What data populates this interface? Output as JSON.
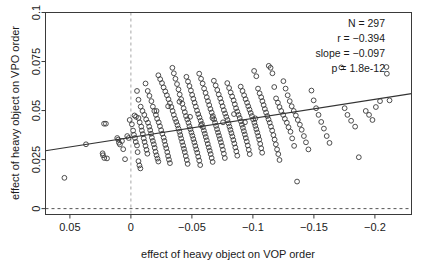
{
  "chart_data": {
    "type": "scatter",
    "title": "",
    "xlabel": "effect of heavy object on VOP order",
    "ylabel": "effect of heavy object on VPO order",
    "xlim": [
      0.07,
      -0.23
    ],
    "ylim": [
      -0.003,
      0.1
    ],
    "x_reversed": true,
    "grid": false,
    "legend": null,
    "xticks": [
      0.05,
      0,
      -0.05,
      -0.1,
      -0.15,
      -0.2
    ],
    "xtick_labels": [
      "0.05",
      "0",
      "-0.05",
      "-0.1",
      "-0.15",
      "-0.2"
    ],
    "yticks": [
      0,
      0.025,
      0.05,
      0.075,
      0.1
    ],
    "ytick_labels": [
      "0",
      "0.025",
      "0.05",
      "0.075",
      "0.1"
    ],
    "reference_lines": [
      {
        "name": "x-zero-line",
        "orientation": "vertical",
        "value": 0,
        "style": "dashed",
        "color": "#a6a6a6"
      },
      {
        "name": "y-zero-line",
        "orientation": "horizontal",
        "value": 0,
        "style": "dashed",
        "color": "#555555"
      }
    ],
    "fit_line": {
      "name": "regression-line",
      "slope": -0.097,
      "x_start": 0.07,
      "y_start": 0.0295,
      "x_end": -0.23,
      "y_end": 0.0586,
      "color": "#333333"
    },
    "annotations": {
      "n": "N = 297",
      "r": "r = −0.394",
      "slope": "slope = −0.097",
      "p": "p = 1.8e-12"
    },
    "marker": {
      "shape": "open-circle",
      "radius": 2.4,
      "stroke": "#3a3a3a",
      "fill": "none"
    },
    "points": [
      [
        0.0545,
        0.0157
      ],
      [
        0.0368,
        0.0328
      ],
      [
        0.022,
        0.0433
      ],
      [
        0.0205,
        0.0433
      ],
      [
        0.0232,
        0.0282
      ],
      [
        0.0229,
        0.0272
      ],
      [
        0.0218,
        0.0258
      ],
      [
        0.0196,
        0.0256
      ],
      [
        0.0112,
        0.036
      ],
      [
        0.0104,
        0.0352
      ],
      [
        0.0098,
        0.0336
      ],
      [
        0.009,
        0.0327
      ],
      [
        0.0073,
        0.0345
      ],
      [
        0.0063,
        0.0303
      ],
      [
        0.0048,
        0.0252
      ],
      [
        0.003,
        0.037
      ],
      [
        0.0018,
        0.036
      ],
      [
        0.001,
        0.0452
      ],
      [
        -0.0008,
        0.043
      ],
      [
        -0.0018,
        0.0398
      ],
      [
        -0.0025,
        0.0376
      ],
      [
        -0.0033,
        0.036
      ],
      [
        -0.004,
        0.034
      ],
      [
        -0.005,
        0.0322
      ],
      [
        -0.0055,
        0.0288
      ],
      [
        -0.0062,
        0.0242
      ],
      [
        -0.007,
        0.022
      ],
      [
        -0.0078,
        0.0205
      ],
      [
        -0.003,
        0.0475
      ],
      [
        -0.0042,
        0.0468
      ],
      [
        -0.0062,
        0.0462
      ],
      [
        -0.0072,
        0.044
      ],
      [
        -0.0085,
        0.0418
      ],
      [
        -0.009,
        0.0398
      ],
      [
        -0.0098,
        0.038
      ],
      [
        -0.0105,
        0.0358
      ],
      [
        -0.0112,
        0.034
      ],
      [
        -0.012,
        0.032
      ],
      [
        -0.0128,
        0.03
      ],
      [
        -0.0135,
        0.028
      ],
      [
        -0.005,
        0.06
      ],
      [
        -0.0062,
        0.0555
      ],
      [
        -0.008,
        0.052
      ],
      [
        -0.0095,
        0.0498
      ],
      [
        -0.011,
        0.0478
      ],
      [
        -0.0125,
        0.0455
      ],
      [
        -0.014,
        0.0438
      ],
      [
        -0.015,
        0.0418
      ],
      [
        -0.0158,
        0.04
      ],
      [
        -0.0165,
        0.0382
      ],
      [
        -0.0172,
        0.0362
      ],
      [
        -0.018,
        0.0345
      ],
      [
        -0.0188,
        0.0328
      ],
      [
        -0.0195,
        0.031
      ],
      [
        -0.0202,
        0.029
      ],
      [
        -0.021,
        0.0272
      ],
      [
        -0.0218,
        0.0255
      ],
      [
        -0.0225,
        0.024
      ],
      [
        -0.012,
        0.0638
      ],
      [
        -0.0138,
        0.06
      ],
      [
        -0.0152,
        0.0575
      ],
      [
        -0.0168,
        0.0548
      ],
      [
        -0.018,
        0.052
      ],
      [
        -0.0192,
        0.0498
      ],
      [
        -0.0205,
        0.0478
      ],
      [
        -0.0215,
        0.0458
      ],
      [
        -0.0228,
        0.044
      ],
      [
        -0.0238,
        0.042
      ],
      [
        -0.0248,
        0.04
      ],
      [
        -0.0258,
        0.0382
      ],
      [
        -0.0268,
        0.0362
      ],
      [
        -0.0275,
        0.0345
      ],
      [
        -0.0282,
        0.0325
      ],
      [
        -0.029,
        0.0308
      ],
      [
        -0.0298,
        0.0288
      ],
      [
        -0.0305,
        0.0268
      ],
      [
        -0.0312,
        0.025
      ],
      [
        -0.032,
        0.0232
      ],
      [
        -0.0225,
        0.068
      ],
      [
        -0.024,
        0.066
      ],
      [
        -0.0255,
        0.064
      ],
      [
        -0.0268,
        0.0618
      ],
      [
        -0.0282,
        0.0598
      ],
      [
        -0.0295,
        0.0578
      ],
      [
        -0.0308,
        0.0558
      ],
      [
        -0.032,
        0.0538
      ],
      [
        -0.0332,
        0.0518
      ],
      [
        -0.0342,
        0.0498
      ],
      [
        -0.0352,
        0.0478
      ],
      [
        -0.0362,
        0.0458
      ],
      [
        -0.0372,
        0.0442
      ],
      [
        -0.0382,
        0.0425
      ],
      [
        -0.039,
        0.0408
      ],
      [
        -0.0398,
        0.0392
      ],
      [
        -0.0405,
        0.0375
      ],
      [
        -0.0412,
        0.0358
      ],
      [
        -0.042,
        0.034
      ],
      [
        -0.0428,
        0.0322
      ],
      [
        -0.0435,
        0.0305
      ],
      [
        -0.0442,
        0.0288
      ],
      [
        -0.045,
        0.0268
      ],
      [
        -0.0458,
        0.0248
      ],
      [
        -0.0465,
        0.0228
      ],
      [
        -0.034,
        0.0718
      ],
      [
        -0.0352,
        0.069
      ],
      [
        -0.0365,
        0.0662
      ],
      [
        -0.0378,
        0.0635
      ],
      [
        -0.039,
        0.0608
      ],
      [
        -0.04,
        0.0582
      ],
      [
        -0.0412,
        0.0558
      ],
      [
        -0.0422,
        0.0535
      ],
      [
        -0.0432,
        0.0512
      ],
      [
        -0.0442,
        0.0492
      ],
      [
        -0.0452,
        0.0472
      ],
      [
        -0.0462,
        0.0455
      ],
      [
        -0.0472,
        0.0438
      ],
      [
        -0.048,
        0.042
      ],
      [
        -0.0488,
        0.0405
      ],
      [
        -0.0496,
        0.0388
      ],
      [
        -0.0504,
        0.0372
      ],
      [
        -0.0512,
        0.0355
      ],
      [
        -0.052,
        0.0338
      ],
      [
        -0.0528,
        0.032
      ],
      [
        -0.0536,
        0.0302
      ],
      [
        -0.0544,
        0.0285
      ],
      [
        -0.0552,
        0.0265
      ],
      [
        -0.056,
        0.0245
      ],
      [
        -0.0568,
        0.0222
      ],
      [
        -0.0455,
        0.0672
      ],
      [
        -0.0468,
        0.0648
      ],
      [
        -0.048,
        0.0625
      ],
      [
        -0.0492,
        0.0602
      ],
      [
        -0.0502,
        0.058
      ],
      [
        -0.0512,
        0.056
      ],
      [
        -0.0522,
        0.054
      ],
      [
        -0.0532,
        0.052
      ],
      [
        -0.0542,
        0.05
      ],
      [
        -0.0552,
        0.0482
      ],
      [
        -0.0562,
        0.0465
      ],
      [
        -0.0572,
        0.0448
      ],
      [
        -0.0582,
        0.0432
      ],
      [
        -0.059,
        0.0415
      ],
      [
        -0.0598,
        0.0398
      ],
      [
        -0.0606,
        0.0382
      ],
      [
        -0.0614,
        0.0365
      ],
      [
        -0.0622,
        0.0348
      ],
      [
        -0.063,
        0.033
      ],
      [
        -0.0638,
        0.0312
      ],
      [
        -0.0646,
        0.0295
      ],
      [
        -0.0654,
        0.0278
      ],
      [
        -0.0662,
        0.0258
      ],
      [
        -0.067,
        0.0238
      ],
      [
        -0.056,
        0.0688
      ],
      [
        -0.0575,
        0.0662
      ],
      [
        -0.0588,
        0.0638
      ],
      [
        -0.06,
        0.0612
      ],
      [
        -0.0612,
        0.059
      ],
      [
        -0.0622,
        0.0568
      ],
      [
        -0.0632,
        0.0548
      ],
      [
        -0.0642,
        0.0528
      ],
      [
        -0.0652,
        0.0508
      ],
      [
        -0.0662,
        0.049
      ],
      [
        -0.0672,
        0.0472
      ],
      [
        -0.0682,
        0.0455
      ],
      [
        -0.069,
        0.0438
      ],
      [
        -0.0698,
        0.0422
      ],
      [
        -0.0706,
        0.0405
      ],
      [
        -0.0714,
        0.0388
      ],
      [
        -0.0722,
        0.0372
      ],
      [
        -0.073,
        0.0355
      ],
      [
        -0.0738,
        0.0338
      ],
      [
        -0.0746,
        0.032
      ],
      [
        -0.0754,
        0.03
      ],
      [
        -0.0762,
        0.028
      ],
      [
        -0.077,
        0.0258
      ],
      [
        -0.068,
        0.0652
      ],
      [
        -0.0695,
        0.0628
      ],
      [
        -0.0708,
        0.0605
      ],
      [
        -0.072,
        0.0582
      ],
      [
        -0.0732,
        0.0562
      ],
      [
        -0.0742,
        0.0542
      ],
      [
        -0.0752,
        0.0522
      ],
      [
        -0.0762,
        0.0502
      ],
      [
        -0.0772,
        0.0485
      ],
      [
        -0.0782,
        0.0468
      ],
      [
        -0.0792,
        0.0452
      ],
      [
        -0.08,
        0.0435
      ],
      [
        -0.0808,
        0.0418
      ],
      [
        -0.0816,
        0.0402
      ],
      [
        -0.0824,
        0.0385
      ],
      [
        -0.0832,
        0.0368
      ],
      [
        -0.084,
        0.035
      ],
      [
        -0.0848,
        0.0332
      ],
      [
        -0.0856,
        0.0312
      ],
      [
        -0.0864,
        0.0292
      ],
      [
        -0.0872,
        0.027
      ],
      [
        -0.079,
        0.064
      ],
      [
        -0.0805,
        0.0615
      ],
      [
        -0.0818,
        0.0592
      ],
      [
        -0.083,
        0.0572
      ],
      [
        -0.0842,
        0.0552
      ],
      [
        -0.0852,
        0.0532
      ],
      [
        -0.0862,
        0.0512
      ],
      [
        -0.0872,
        0.0495
      ],
      [
        -0.0882,
        0.0478
      ],
      [
        -0.0892,
        0.0462
      ],
      [
        -0.0902,
        0.0445
      ],
      [
        -0.091,
        0.0428
      ],
      [
        -0.0918,
        0.0412
      ],
      [
        -0.0926,
        0.0395
      ],
      [
        -0.0934,
        0.0378
      ],
      [
        -0.0942,
        0.036
      ],
      [
        -0.095,
        0.0342
      ],
      [
        -0.0958,
        0.0322
      ],
      [
        -0.0966,
        0.03
      ],
      [
        -0.0974,
        0.0278
      ],
      [
        -0.09,
        0.0622
      ],
      [
        -0.0915,
        0.06
      ],
      [
        -0.0928,
        0.0578
      ],
      [
        -0.094,
        0.0558
      ],
      [
        -0.0952,
        0.054
      ],
      [
        -0.0962,
        0.0522
      ],
      [
        -0.0972,
        0.0505
      ],
      [
        -0.0982,
        0.0488
      ],
      [
        -0.0992,
        0.0472
      ],
      [
        -0.1002,
        0.0455
      ],
      [
        -0.1012,
        0.0438
      ],
      [
        -0.102,
        0.0422
      ],
      [
        -0.1028,
        0.0405
      ],
      [
        -0.1036,
        0.0388
      ],
      [
        -0.1044,
        0.037
      ],
      [
        -0.1052,
        0.0352
      ],
      [
        -0.106,
        0.033
      ],
      [
        -0.1068,
        0.0308
      ],
      [
        -0.1076,
        0.0285
      ],
      [
        -0.101,
        0.0702
      ],
      [
        -0.1028,
        0.0675
      ],
      [
        -0.1042,
        0.0612
      ],
      [
        -0.1055,
        0.0588
      ],
      [
        -0.1068,
        0.0568
      ],
      [
        -0.1078,
        0.0548
      ],
      [
        -0.1088,
        0.0528
      ],
      [
        -0.1098,
        0.0508
      ],
      [
        -0.1108,
        0.049
      ],
      [
        -0.1118,
        0.0472
      ],
      [
        -0.1128,
        0.0455
      ],
      [
        -0.1138,
        0.0438
      ],
      [
        -0.1148,
        0.0418
      ],
      [
        -0.1158,
        0.0398
      ],
      [
        -0.1168,
        0.0375
      ],
      [
        -0.1178,
        0.0352
      ],
      [
        -0.1188,
        0.0328
      ],
      [
        -0.1198,
        0.0302
      ],
      [
        -0.1208,
        0.0278
      ],
      [
        -0.1218,
        0.0248
      ],
      [
        -0.113,
        0.0728
      ],
      [
        -0.1145,
        0.0718
      ],
      [
        -0.116,
        0.069
      ],
      [
        -0.1175,
        0.062
      ],
      [
        -0.119,
        0.0562
      ],
      [
        -0.1205,
        0.054
      ],
      [
        -0.1218,
        0.0518
      ],
      [
        -0.1232,
        0.0498
      ],
      [
        -0.1248,
        0.0478
      ],
      [
        -0.1262,
        0.0458
      ],
      [
        -0.1278,
        0.0438
      ],
      [
        -0.1292,
        0.0415
      ],
      [
        -0.1308,
        0.0392
      ],
      [
        -0.1322,
        0.0358
      ],
      [
        -0.1338,
        0.032
      ],
      [
        -0.125,
        0.065
      ],
      [
        -0.1268,
        0.0612
      ],
      [
        -0.1285,
        0.0578
      ],
      [
        -0.1302,
        0.0548
      ],
      [
        -0.1318,
        0.0522
      ],
      [
        -0.1335,
        0.0498
      ],
      [
        -0.1352,
        0.0475
      ],
      [
        -0.1368,
        0.0452
      ],
      [
        -0.1385,
        0.0428
      ],
      [
        -0.14,
        0.0402
      ],
      [
        -0.1418,
        0.037
      ],
      [
        -0.1435,
        0.0338
      ],
      [
        -0.1455,
        0.0302
      ],
      [
        -0.1362,
        0.0138
      ],
      [
        -0.148,
        0.0602
      ],
      [
        -0.1498,
        0.0552
      ],
      [
        -0.1518,
        0.0512
      ],
      [
        -0.1538,
        0.0478
      ],
      [
        -0.156,
        0.0442
      ],
      [
        -0.1582,
        0.0408
      ],
      [
        -0.1605,
        0.037
      ],
      [
        -0.1628,
        0.0335
      ],
      [
        -0.1725,
        0.072
      ],
      [
        -0.1752,
        0.0512
      ],
      [
        -0.1775,
        0.0478
      ],
      [
        -0.1805,
        0.0448
      ],
      [
        -0.1838,
        0.0418
      ],
      [
        -0.1868,
        0.0262
      ],
      [
        -0.1925,
        0.0498
      ],
      [
        -0.1952,
        0.0478
      ],
      [
        -0.198,
        0.0452
      ],
      [
        -0.2008,
        0.0518
      ],
      [
        -0.2042,
        0.0548
      ],
      [
        -0.2095,
        0.0722
      ],
      [
        -0.2098,
        0.0688
      ],
      [
        -0.212,
        0.0552
      ],
      [
        -0.021,
        0.0498
      ],
      [
        -0.0305,
        0.0522
      ],
      [
        -0.0398,
        0.0545
      ],
      [
        -0.0485,
        0.0468
      ],
      [
        -0.0575,
        0.0425
      ],
      [
        -0.0668,
        0.0462
      ],
      [
        -0.0755,
        0.044
      ],
      [
        -0.0845,
        0.0482
      ],
      [
        -0.0935,
        0.044
      ],
      [
        -0.102,
        0.046
      ]
    ]
  }
}
